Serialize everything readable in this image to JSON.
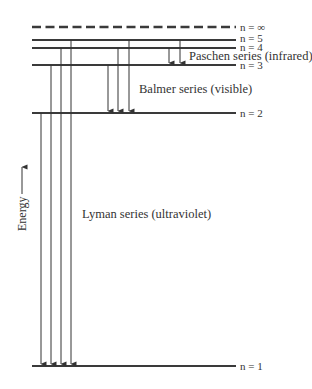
{
  "diagram": {
    "axis_label": "Energy",
    "levels": [
      {
        "n": "∞",
        "label_n": "n",
        "label_rest": " = ∞",
        "y": 27,
        "style": "dashed"
      },
      {
        "n": "5",
        "label_n": "n",
        "label_rest": " = 5",
        "y": 40,
        "style": "solid"
      },
      {
        "n": "4",
        "label_n": "n",
        "label_rest": " = 4",
        "y": 48,
        "style": "solid"
      },
      {
        "n": "3",
        "label_n": "n",
        "label_rest": " = 3",
        "y": 65,
        "style": "solid"
      },
      {
        "n": "2",
        "label_n": "n",
        "label_rest": " = 2",
        "y": 113,
        "style": "solid"
      },
      {
        "n": "1",
        "label_n": "n",
        "label_rest": " = 1",
        "y": 366,
        "style": "solid"
      }
    ],
    "series": [
      {
        "name": "Lyman series (ultraviolet)",
        "final_level": "1",
        "transitions": [
          {
            "from": "2",
            "x": 41
          },
          {
            "from": "3",
            "x": 51
          },
          {
            "from": "4",
            "x": 61
          },
          {
            "from": "5",
            "x": 71
          }
        ]
      },
      {
        "name": "Balmer series (visible)",
        "final_level": "2",
        "transitions": [
          {
            "from": "3",
            "x": 108
          },
          {
            "from": "4",
            "x": 118
          },
          {
            "from": "5",
            "x": 129
          }
        ]
      },
      {
        "name": "Paschen series (infrared)",
        "final_level": "3",
        "transitions": [
          {
            "from": "4",
            "x": 169
          },
          {
            "from": "5",
            "x": 180
          }
        ]
      }
    ]
  },
  "labels": {
    "level_inf": "n = ∞",
    "level_5": "n = 5",
    "level_4": "n = 4",
    "level_3": "n = 3",
    "level_2": "n = 2",
    "level_1": "n = 1",
    "paschen": "Paschen series (infrared)",
    "balmer": "Balmer series (visible)",
    "lyman": "Lyman series (ultraviolet)",
    "energy": "Energy"
  },
  "colors": {
    "line": "#3a3a3a",
    "text": "#333333",
    "background": "#ffffff"
  }
}
